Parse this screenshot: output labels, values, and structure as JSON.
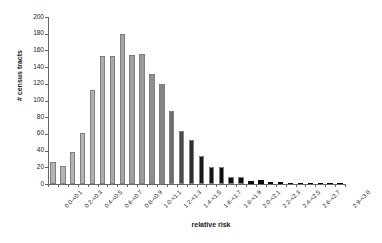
{
  "chart_data": {
    "type": "bar",
    "title": "",
    "xlabel": "relative risk",
    "ylabel": "# census tracts",
    "ylim": [
      0,
      200
    ],
    "ytick_values": [
      0,
      20,
      40,
      60,
      80,
      100,
      120,
      140,
      160,
      180,
      200
    ],
    "grid": false,
    "legend": "none",
    "categories": [
      "0.0-<0.1",
      "0.1-<0.2",
      "0.2-<0.3",
      "0.3-<0.4",
      "0.4-<0.5",
      "0.5-<0.6",
      "0.6-<0.7",
      "0.7-<0.8",
      "0.8-<0.9",
      "0.9-<1.0",
      "1.0-<1.1",
      "1.1-<1.2",
      "1.2-<1.3",
      "1.3-<1.4",
      "1.4-<1.5",
      "1.5-<1.6",
      "1.6-<1.7",
      "1.7-<1.8",
      "1.8-<1.9",
      "1.9-<2.0",
      "2.0-<2.1",
      "2.1-<2.2",
      "2.2-<2.3",
      "2.3-<2.4",
      "2.4-<2.5",
      "2.5-<2.6",
      "2.6-<2.7",
      "2.7-<2.8",
      "2.8-<2.9",
      "2.9-<3.0"
    ],
    "labeled_categories": [
      "0.0-<0.1",
      "0.2-<0.3",
      "0.4-<0.5",
      "0.6-<0.7",
      "0.8-<0.9",
      "1.0-<1.1",
      "1.2-<1.3",
      "1.4-<1.5",
      "1.6-<1.7",
      "1.8-<1.9",
      "2.0-<2.1",
      "2.2-<2.3",
      "2.4-<2.5",
      "2.6-<2.7",
      "2.9-<3.0"
    ],
    "values": [
      26,
      21,
      38,
      61,
      112,
      153,
      153,
      180,
      155,
      156,
      132,
      120,
      87,
      64,
      53,
      33,
      20,
      20,
      9,
      9,
      4,
      5,
      2,
      2,
      1,
      1,
      1,
      1,
      1,
      1
    ],
    "bar_colors": [
      "#b3b3b3",
      "#b3b3b3",
      "#b3b3b3",
      "#b3b3b3",
      "#b0b0b0",
      "#ababab",
      "#a8a8a8",
      "#a5a5a5",
      "#a0a0a0",
      "#9b9b9b",
      "#8f8f8f",
      "#848484",
      "#6e6e6e",
      "#4a4a4a",
      "#2e2e2e",
      "#1a1a1a",
      "#141414",
      "#111111",
      "#0d0d0d",
      "#0d0d0d",
      "#0a0a0a",
      "#0a0a0a",
      "#080808",
      "#080808",
      "#060606",
      "#060606",
      "#050505",
      "#050505",
      "#040404",
      "#040404"
    ],
    "bar_border_color": "#808080",
    "axis_color": "#666666"
  }
}
